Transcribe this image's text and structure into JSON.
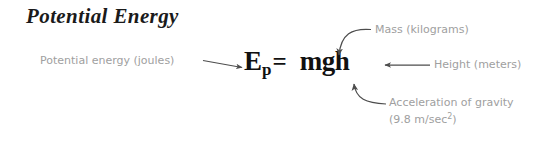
{
  "canvas": {
    "width": 556,
    "height": 142,
    "background": "#ffffff"
  },
  "title": {
    "text": "Potential Energy",
    "color": "#1a1a1a",
    "style": "bold-italic-serif"
  },
  "formula": {
    "variable": "E",
    "subscript": "p",
    "equals": "=",
    "expression": "mgh",
    "full_text": "Ep = mgh",
    "color": "#111111"
  },
  "annotations": {
    "color": "#a0a0a0",
    "arrow_color": "#4d4d4d",
    "items": [
      {
        "id": "potential-energy",
        "label": "Potential energy (joules)",
        "points_to": "E",
        "arrow": "straight-right"
      },
      {
        "id": "mass",
        "label": "Mass (kilograms)",
        "points_to": "m",
        "arrow": "curved-down-left"
      },
      {
        "id": "height",
        "label": "Height (meters)",
        "points_to": "h",
        "arrow": "straight-left"
      },
      {
        "id": "gravity",
        "label_line1": "Acceleration of gravity",
        "label_line2_prefix": "(9.8 m/sec",
        "label_line2_sup": "2",
        "label_line2_suffix": ")",
        "points_to": "g",
        "arrow": "curved-up-left"
      }
    ]
  }
}
